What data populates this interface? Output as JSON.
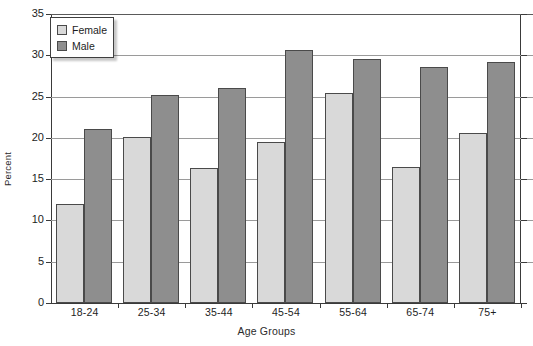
{
  "chart_data": {
    "type": "bar",
    "title": "",
    "xlabel": "Age Groups",
    "ylabel": "Percent",
    "categories": [
      "18-24",
      "25-34",
      "35-44",
      "45-54",
      "55-64",
      "65-74",
      "75+"
    ],
    "series": [
      {
        "name": "Female",
        "color": "#d9d9d9",
        "values": [
          12.0,
          20.1,
          16.4,
          19.5,
          25.4,
          16.5,
          20.6
        ]
      },
      {
        "name": "Male",
        "color": "#8e8e8e",
        "values": [
          21.1,
          25.2,
          26.1,
          30.6,
          29.5,
          28.6,
          29.2
        ]
      }
    ],
    "ylim": [
      0,
      35
    ],
    "yticks": [
      0,
      5,
      10,
      15,
      20,
      25,
      30,
      35
    ],
    "ytick_labels": [
      "0",
      "5",
      "10",
      "15",
      "20",
      "25",
      "30",
      "35"
    ],
    "grid": true,
    "grid_axis": "y",
    "legend_position": "top-left",
    "legend_entries": [
      "Female",
      "Male"
    ]
  }
}
